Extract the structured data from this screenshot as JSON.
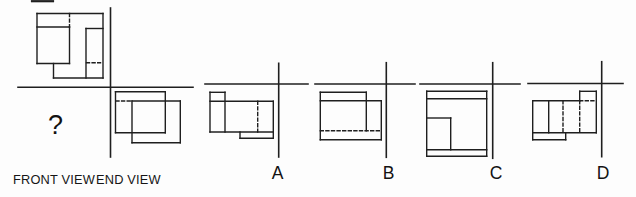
{
  "canvas": {
    "width": 636,
    "height": 197,
    "background": "#fdfdfd"
  },
  "problem": {
    "front_view_label": "FRONT VIEW",
    "end_view_label": "END VIEW",
    "missing_view_marker": "?"
  },
  "options": [
    {
      "label": "A"
    },
    {
      "label": "B"
    },
    {
      "label": "C"
    },
    {
      "label": "D"
    }
  ],
  "drawing": {
    "stroke": "#1f1f1f",
    "dash": "3 2.6",
    "groups": [
      {
        "name": "main-axes",
        "w": 1.6,
        "segments": [
          [
            110.5,
            8,
            110.5,
            157
          ],
          [
            18,
            87.3,
            193,
            87.3
          ]
        ]
      },
      {
        "name": "top-view",
        "w": 1.4,
        "segments": [
          [
            37,
            13.5,
            103,
            13.5
          ],
          [
            103,
            13.5,
            103,
            78
          ],
          [
            53.5,
            78,
            103,
            78
          ],
          [
            53.5,
            63.5,
            53.5,
            78
          ],
          [
            37,
            63.5,
            69.5,
            63.5
          ],
          [
            37,
            13.5,
            37,
            63.5
          ],
          [
            37,
            27,
            69.5,
            27
          ],
          [
            69.5,
            27,
            69.5,
            63.5
          ],
          [
            86,
            28.5,
            103,
            28.5
          ],
          [
            86,
            28.5,
            86,
            78
          ],
          [
            69.5,
            13.5,
            69.5,
            27,
            1
          ],
          [
            86.5,
            62.8,
            100.5,
            62.8,
            1
          ]
        ]
      },
      {
        "name": "end-view",
        "w": 1.4,
        "segments": [
          [
            115.5,
            91.7,
            165.3,
            91.7
          ],
          [
            115.5,
            91.7,
            115.5,
            132.7
          ],
          [
            115.5,
            132.7,
            165.3,
            132.7
          ],
          [
            165.3,
            91.7,
            165.3,
            132.7
          ],
          [
            132,
            101,
            180.3,
            101
          ],
          [
            180.3,
            101,
            180.3,
            142.7
          ],
          [
            132,
            142.7,
            180.3,
            142.7
          ],
          [
            132,
            101,
            132,
            142.7
          ],
          [
            116,
            101,
            132,
            101,
            1
          ]
        ]
      },
      {
        "name": "option-a-axes",
        "w": 1.6,
        "segments": [
          [
            278.7,
            63.3,
            278.7,
            157
          ],
          [
            205,
            84,
            308,
            84
          ]
        ]
      },
      {
        "name": "option-a-shape",
        "w": 1.4,
        "segments": [
          [
            210,
            92.3,
            225,
            92.3
          ],
          [
            210,
            92.3,
            210,
            132
          ],
          [
            225,
            92.3,
            225,
            132
          ],
          [
            210,
            101.3,
            273.3,
            101.3
          ],
          [
            273.3,
            101.3,
            273.3,
            138.3
          ],
          [
            210,
            132,
            273.3,
            132
          ],
          [
            240,
            132,
            240,
            138.3
          ],
          [
            240,
            138.3,
            273.3,
            138.3
          ],
          [
            257.7,
            101.3,
            257.7,
            132,
            1
          ]
        ]
      },
      {
        "name": "option-b-axes",
        "w": 1.6,
        "segments": [
          [
            386.3,
            62.7,
            386.3,
            157.3
          ],
          [
            315,
            84,
            415,
            84
          ]
        ]
      },
      {
        "name": "option-b-shape",
        "w": 1.4,
        "segments": [
          [
            320.3,
            92.3,
            366.3,
            92.3
          ],
          [
            320.3,
            92.3,
            320.3,
            139.7
          ],
          [
            366.3,
            92.3,
            366.3,
            130.7
          ],
          [
            320.3,
            100.7,
            381.3,
            100.7
          ],
          [
            381.3,
            100.7,
            381.3,
            139.7
          ],
          [
            320.3,
            139.7,
            381.3,
            139.7
          ],
          [
            320.3,
            130.7,
            381.3,
            130.7,
            1
          ]
        ]
      },
      {
        "name": "option-c-axes",
        "w": 1.6,
        "segments": [
          [
            492.7,
            62.7,
            492.7,
            158.3
          ],
          [
            420,
            84,
            520,
            84
          ]
        ]
      },
      {
        "name": "option-c-shape",
        "w": 1.4,
        "segments": [
          [
            426.7,
            91.3,
            486.7,
            91.3
          ],
          [
            426.7,
            91.3,
            426.7,
            156.3
          ],
          [
            486.7,
            91.3,
            486.7,
            156.3
          ],
          [
            426.7,
            156.3,
            486.7,
            156.3
          ],
          [
            426.7,
            98.7,
            486.7,
            98.7
          ],
          [
            426.7,
            149.7,
            486.7,
            149.7
          ],
          [
            426.7,
            118,
            450.7,
            118
          ],
          [
            450.7,
            118,
            450.7,
            149.7
          ]
        ]
      },
      {
        "name": "option-d-axes",
        "w": 1.6,
        "segments": [
          [
            601.7,
            61.7,
            601.7,
            156.7
          ],
          [
            528,
            83.5,
            623,
            83.5
          ]
        ]
      },
      {
        "name": "option-d-shape",
        "w": 1.4,
        "segments": [
          [
            579.7,
            91.3,
            596.3,
            91.3
          ],
          [
            579.7,
            91.3,
            579.7,
            100.7
          ],
          [
            596.3,
            91.3,
            596.3,
            132.7
          ],
          [
            532.7,
            100.7,
            579.7,
            100.7
          ],
          [
            532.7,
            100.7,
            532.7,
            139.7
          ],
          [
            548.7,
            100.7,
            548.7,
            132.7
          ],
          [
            532.7,
            132.7,
            596.3,
            132.7
          ],
          [
            565.7,
            132.7,
            565.7,
            139.7
          ],
          [
            532.7,
            139.7,
            565.7,
            139.7
          ],
          [
            579.7,
            100.7,
            596.3,
            100.7,
            1
          ],
          [
            563,
            100.7,
            563,
            132.7,
            1
          ],
          [
            579.7,
            100.7,
            579.7,
            132.7,
            1
          ]
        ]
      },
      {
        "name": "scan-artifact",
        "w": 2.2,
        "segments": [
          [
            32,
            1.2,
            53,
            1.2
          ]
        ]
      }
    ]
  }
}
